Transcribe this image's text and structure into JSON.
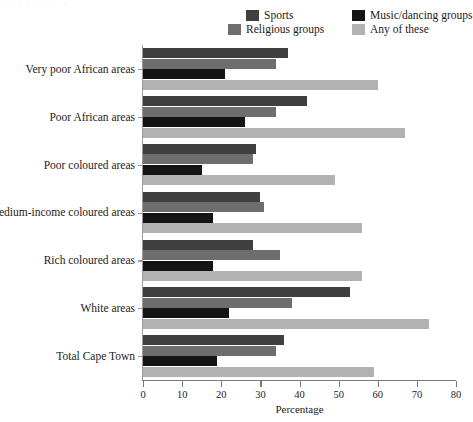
{
  "top_strip": {
    "text": "· · · · · · · ·"
  },
  "legend": {
    "position": "top-right",
    "items": [
      {
        "label": "Sports",
        "color": "#3f3f3f",
        "key": "sports"
      },
      {
        "label": "Religious groups",
        "color": "#6e6e6e",
        "key": "religious"
      },
      {
        "label": "Music/dancing groups",
        "color": "#141414",
        "key": "music"
      },
      {
        "label": "Any of these",
        "color": "#b2b2b2",
        "key": "any"
      }
    ]
  },
  "axes": {
    "xlabel": "Percentage",
    "ylabel": "",
    "xticks": [
      "0",
      "10",
      "20",
      "30",
      "40",
      "50",
      "60",
      "70",
      "80"
    ]
  },
  "chart_data": {
    "type": "bar",
    "orientation": "horizontal",
    "title": "",
    "subtitle": "",
    "xlabel": "Percentage",
    "ylabel": "",
    "xlim": [
      0,
      80
    ],
    "xticks": [
      0,
      10,
      20,
      30,
      40,
      50,
      60,
      70,
      80
    ],
    "grid": false,
    "legend_position": "top-right",
    "categories": [
      "Very poor African areas",
      "Poor African areas",
      "Poor coloured areas",
      "Medium-income coloured areas",
      "Rich coloured areas",
      "White areas",
      "Total Cape Town"
    ],
    "series": [
      {
        "name": "Sports",
        "color": "#3f3f3f",
        "values": [
          37,
          42,
          29,
          30,
          28,
          53,
          36
        ]
      },
      {
        "name": "Religious groups",
        "color": "#6e6e6e",
        "values": [
          34,
          34,
          28,
          31,
          35,
          38,
          34
        ]
      },
      {
        "name": "Music/dancing groups",
        "color": "#141414",
        "values": [
          21,
          26,
          15,
          18,
          18,
          22,
          19
        ]
      },
      {
        "name": "Any of these",
        "color": "#b2b2b2",
        "values": [
          60,
          67,
          49,
          56,
          56,
          73,
          59
        ]
      }
    ]
  }
}
